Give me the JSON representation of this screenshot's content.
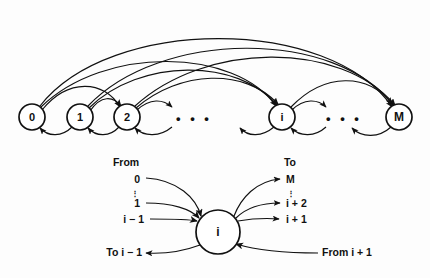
{
  "figure": {
    "background_color": "#fdfdfd",
    "stroke_color": "#111111"
  },
  "top_panel": {
    "name": "full-chain-diagram",
    "nodes": [
      {
        "id": "n0",
        "label": "0",
        "cx": 32,
        "cy": 117,
        "r": 13
      },
      {
        "id": "n1",
        "label": "1",
        "cx": 80,
        "cy": 117,
        "r": 13
      },
      {
        "id": "n2",
        "label": "2",
        "cx": 127,
        "cy": 117,
        "r": 13
      },
      {
        "id": "ni",
        "label": "i",
        "cx": 282,
        "cy": 117,
        "r": 13
      },
      {
        "id": "nM",
        "label": "M",
        "cx": 399,
        "cy": 117,
        "r": 13
      }
    ],
    "ellipses": [
      {
        "id": "e1",
        "label": "• • •",
        "cx": 194,
        "cy": 117
      },
      {
        "id": "e2",
        "label": "• • •",
        "cx": 344,
        "cy": 117
      }
    ]
  },
  "bottom_panel": {
    "name": "state-i-detail-diagram",
    "center_node": {
      "label": "i",
      "cx": 218,
      "cy": 232,
      "r": 22
    },
    "from_heading": "From",
    "to_heading": "To",
    "from_labels": [
      {
        "text": "0",
        "x": 134,
        "y": 180
      },
      {
        "text": "1",
        "x": 134,
        "y": 205
      },
      {
        "text": "i − 1",
        "x": 134,
        "y": 220
      }
    ],
    "to_labels": [
      {
        "text": "M",
        "x": 289,
        "y": 180
      },
      {
        "text": "i + 2",
        "x": 289,
        "y": 205
      },
      {
        "text": "i + 1",
        "x": 289,
        "y": 220
      }
    ],
    "bottom_left_label": "To i − 1",
    "bottom_right_label": "From i + 1",
    "from_vdots": "⋮",
    "to_vdots": "⋮"
  }
}
